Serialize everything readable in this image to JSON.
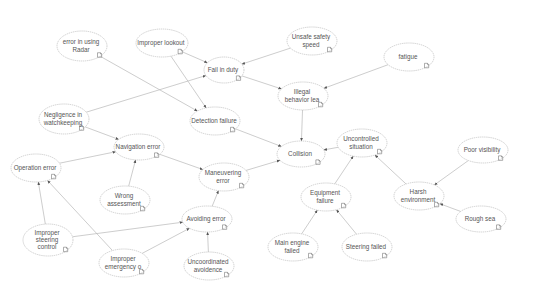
{
  "diagram": {
    "title": "",
    "type": "causal network",
    "background": "#ffffff",
    "edge_color": "#b8b8b8",
    "node_stroke": "#bdbdbd",
    "text_color": "#555555",
    "nodes": [
      {
        "id": "radar",
        "lines": [
          "error in using",
          "Radar"
        ],
        "cx": 82,
        "cy": 46,
        "rx": 25,
        "ry": 15
      },
      {
        "id": "lookout",
        "lines": [
          "Improper lookout"
        ],
        "cx": 162,
        "cy": 43,
        "rx": 26,
        "ry": 14
      },
      {
        "id": "unsafe_speed",
        "lines": [
          "Unsafe safety",
          "speed"
        ],
        "cx": 312,
        "cy": 41,
        "rx": 25,
        "ry": 14
      },
      {
        "id": "fail_duty",
        "lines": [
          "Fail in duty"
        ],
        "cx": 224,
        "cy": 70,
        "rx": 20,
        "ry": 13
      },
      {
        "id": "fatigue",
        "lines": [
          "fatigue"
        ],
        "cx": 409,
        "cy": 57,
        "rx": 25,
        "ry": 14
      },
      {
        "id": "illegal",
        "lines": [
          "Illegal",
          "behavior lea"
        ],
        "cx": 303,
        "cy": 96,
        "rx": 25,
        "ry": 14
      },
      {
        "id": "negligence",
        "lines": [
          "Negligence in",
          "watchkeeping"
        ],
        "cx": 64,
        "cy": 119,
        "rx": 25,
        "ry": 15
      },
      {
        "id": "detection",
        "lines": [
          "Detection failure"
        ],
        "cx": 215,
        "cy": 121,
        "rx": 25,
        "ry": 14
      },
      {
        "id": "uncontrolled",
        "lines": [
          "Uncontrolled",
          "situation"
        ],
        "cx": 362,
        "cy": 143,
        "rx": 25,
        "ry": 14
      },
      {
        "id": "collision",
        "lines": [
          "Collision"
        ],
        "cx": 301,
        "cy": 154,
        "rx": 24,
        "ry": 13
      },
      {
        "id": "navigation",
        "lines": [
          "Navigation error"
        ],
        "cx": 139,
        "cy": 147,
        "rx": 25,
        "ry": 13
      },
      {
        "id": "operation",
        "lines": [
          "Operation error"
        ],
        "cx": 36,
        "cy": 168,
        "rx": 25,
        "ry": 14
      },
      {
        "id": "maneuvering",
        "lines": [
          "Maneuvering",
          "error"
        ],
        "cx": 224,
        "cy": 177,
        "rx": 25,
        "ry": 14
      },
      {
        "id": "visibility",
        "lines": [
          "Poor visibility"
        ],
        "cx": 483,
        "cy": 150,
        "rx": 25,
        "ry": 13
      },
      {
        "id": "assessment",
        "lines": [
          "Wrong",
          "assessment"
        ],
        "cx": 125,
        "cy": 200,
        "rx": 25,
        "ry": 14
      },
      {
        "id": "equipment",
        "lines": [
          "Equipment",
          "failure"
        ],
        "cx": 326,
        "cy": 197,
        "rx": 25,
        "ry": 14
      },
      {
        "id": "harsh",
        "lines": [
          "Harsh",
          "environment"
        ],
        "cx": 419,
        "cy": 196,
        "rx": 25,
        "ry": 14
      },
      {
        "id": "avoiding",
        "lines": [
          "Avoiding error"
        ],
        "cx": 207,
        "cy": 219,
        "rx": 25,
        "ry": 13
      },
      {
        "id": "rough_sea",
        "lines": [
          "Rough sea"
        ],
        "cx": 481,
        "cy": 219,
        "rx": 25,
        "ry": 13
      },
      {
        "id": "steering_control",
        "lines": [
          "Improper",
          "steering",
          "control"
        ],
        "cx": 48,
        "cy": 240,
        "rx": 25,
        "ry": 16
      },
      {
        "id": "main_engine",
        "lines": [
          "Main engine",
          "failed"
        ],
        "cx": 293,
        "cy": 247,
        "rx": 25,
        "ry": 14
      },
      {
        "id": "steering_failed",
        "lines": [
          "Steering failed"
        ],
        "cx": 367,
        "cy": 247,
        "rx": 25,
        "ry": 14
      },
      {
        "id": "emergency",
        "lines": [
          "Improper",
          "emergency o"
        ],
        "cx": 124,
        "cy": 263,
        "rx": 25,
        "ry": 14
      },
      {
        "id": "uncoord",
        "lines": [
          "Uncoordinated",
          "avoidence"
        ],
        "cx": 209,
        "cy": 266,
        "rx": 25,
        "ry": 14
      }
    ],
    "edges": [
      {
        "from": "lookout",
        "to": "fail_duty"
      },
      {
        "from": "unsafe_speed",
        "to": "fail_duty"
      },
      {
        "from": "negligence",
        "to": "fail_duty"
      },
      {
        "from": "fail_duty",
        "to": "illegal"
      },
      {
        "from": "fatigue",
        "to": "illegal"
      },
      {
        "from": "radar",
        "to": "detection"
      },
      {
        "from": "lookout",
        "to": "detection"
      },
      {
        "from": "illegal",
        "to": "collision"
      },
      {
        "from": "detection",
        "to": "collision"
      },
      {
        "from": "maneuvering",
        "to": "collision"
      },
      {
        "from": "uncontrolled",
        "to": "collision"
      },
      {
        "from": "negligence",
        "to": "navigation"
      },
      {
        "from": "operation",
        "to": "navigation"
      },
      {
        "from": "assessment",
        "to": "navigation"
      },
      {
        "from": "navigation",
        "to": "maneuvering"
      },
      {
        "from": "avoiding",
        "to": "maneuvering"
      },
      {
        "from": "steering_control",
        "to": "operation"
      },
      {
        "from": "emergency",
        "to": "operation"
      },
      {
        "from": "steering_control",
        "to": "avoiding"
      },
      {
        "from": "emergency",
        "to": "avoiding"
      },
      {
        "from": "uncoord",
        "to": "avoiding"
      },
      {
        "from": "equipment",
        "to": "uncontrolled"
      },
      {
        "from": "harsh",
        "to": "uncontrolled"
      },
      {
        "from": "visibility",
        "to": "harsh"
      },
      {
        "from": "rough_sea",
        "to": "harsh"
      },
      {
        "from": "main_engine",
        "to": "equipment"
      },
      {
        "from": "steering_failed",
        "to": "equipment"
      }
    ]
  }
}
